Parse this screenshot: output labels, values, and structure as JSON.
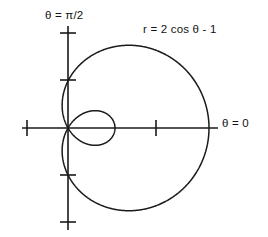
{
  "figure": {
    "title": "",
    "background_color": "#ffffff",
    "ink_color": "#1a1a1a"
  },
  "labels": {
    "equation": "r = 2 cos θ - 1",
    "axis_vertical": "θ = π/2",
    "axis_horizontal": "θ = 0"
  },
  "chart_data": {
    "type": "line",
    "plot_kind": "polar",
    "title": "",
    "annotations": [
      {
        "text": "r = 2 cos θ - 1",
        "x": 1.6,
        "y": 1.8
      },
      {
        "text": "θ = π/2",
        "x": -0.5,
        "y": 2.55
      },
      {
        "text": "θ = 0",
        "x": 3.3,
        "y": 0.0
      }
    ],
    "xlabel": "",
    "ylabel": "",
    "grid": false,
    "legend": false,
    "xlim": [
      -1.0,
      3.2
    ],
    "ylim": [
      -2.2,
      2.2
    ],
    "axis_horizontal_ticks": [
      -1,
      2
    ],
    "axis_vertical_ticks": [
      -2,
      -1,
      1,
      2
    ],
    "equation": "r = 2*cos(theta) - 1",
    "curve_name": "limacon with inner loop",
    "theta_range_degrees": [
      0,
      360
    ],
    "features": {
      "outer_loop_max_r": 1.0,
      "outer_rightmost_x": 1.0,
      "outer_top_y": 1.76,
      "outer_bottom_y": -1.76,
      "inner_loop_rightmost_x": 0.95,
      "pole_angles_degrees": [
        60,
        300
      ],
      "r_at_theta_0": 1.0,
      "r_at_theta_180": -3.0
    },
    "series": [
      {
        "name": "r = 2 cos θ - 1",
        "theta_deg": [
          0,
          10,
          20,
          30,
          40,
          50,
          60,
          70,
          80,
          90,
          100,
          110,
          120,
          130,
          140,
          150,
          160,
          170,
          180,
          190,
          200,
          210,
          220,
          230,
          240,
          250,
          260,
          270,
          280,
          290,
          300,
          310,
          320,
          330,
          340,
          350,
          360
        ],
        "r": [
          1.0,
          0.97,
          0.88,
          0.73,
          0.53,
          0.29,
          0.0,
          -0.32,
          -0.65,
          -1.0,
          -1.35,
          -1.68,
          -2.0,
          -2.29,
          -2.53,
          -2.73,
          -2.88,
          -2.97,
          -3.0,
          -2.97,
          -2.88,
          -2.73,
          -2.53,
          -2.29,
          -2.0,
          -1.68,
          -1.35,
          -1.0,
          -0.65,
          -0.32,
          0.0,
          0.29,
          0.53,
          0.73,
          0.88,
          0.97,
          1.0
        ]
      }
    ]
  }
}
